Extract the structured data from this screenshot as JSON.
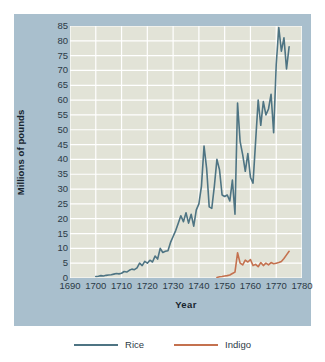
{
  "chart_data": {
    "type": "line",
    "title": "",
    "subtitle": "",
    "xlabel": "Year",
    "ylabel": "Millions of pounds",
    "xlim": [
      1690,
      1780
    ],
    "ylim": [
      0,
      85
    ],
    "xticks": [
      1690,
      1700,
      1710,
      1720,
      1730,
      1740,
      1750,
      1760,
      1770,
      1780
    ],
    "yticks": [
      0,
      5,
      10,
      15,
      20,
      25,
      30,
      35,
      40,
      45,
      50,
      55,
      60,
      65,
      70,
      75,
      80,
      85
    ],
    "grid": "both",
    "grid_color": "#ffffff",
    "plot_background": "#e2e3d7",
    "panel_background": "#a9bfcd",
    "legend_position": "bottom",
    "series": [
      {
        "name": "Rice",
        "color": "#4e7483",
        "x": [
          1700,
          1701,
          1702,
          1703,
          1704,
          1705,
          1706,
          1707,
          1708,
          1709,
          1710,
          1711,
          1712,
          1713,
          1714,
          1715,
          1716,
          1717,
          1718,
          1719,
          1720,
          1721,
          1722,
          1723,
          1724,
          1725,
          1726,
          1727,
          1728,
          1729,
          1730,
          1731,
          1732,
          1733,
          1734,
          1735,
          1736,
          1737,
          1738,
          1739,
          1740,
          1741,
          1742,
          1743,
          1744,
          1745,
          1746,
          1747,
          1748,
          1749,
          1750,
          1751,
          1752,
          1753,
          1754,
          1755,
          1756,
          1757,
          1758,
          1759,
          1760,
          1761,
          1762,
          1763,
          1764,
          1765,
          1766,
          1767,
          1768,
          1769,
          1770,
          1771,
          1772,
          1773,
          1774,
          1775
        ],
        "y": [
          0.5,
          0.6,
          0.8,
          0.7,
          0.9,
          1.0,
          1.1,
          1.3,
          1.5,
          1.4,
          1.6,
          2.2,
          2.0,
          2.6,
          3.0,
          2.8,
          3.4,
          5.0,
          4.2,
          5.6,
          5.0,
          6.0,
          5.4,
          7.4,
          6.4,
          10.0,
          8.6,
          9.0,
          9.2,
          12.0,
          14.0,
          16.0,
          18.5,
          21.0,
          19.0,
          22.0,
          18.5,
          21.5,
          17.5,
          23.0,
          25.0,
          31.0,
          44.5,
          37.0,
          24.0,
          23.5,
          31.0,
          40.0,
          36.5,
          28.0,
          27.5,
          28.0,
          26.0,
          33.0,
          21.5,
          59.0,
          46.0,
          41.5,
          36.0,
          42.0,
          34.0,
          32.0,
          46.0,
          60.0,
          51.5,
          59.5,
          55.0,
          57.0,
          62.0,
          49.0,
          72.0,
          84.5,
          76.5,
          81.0,
          70.5,
          78.0
        ]
      },
      {
        "name": "Indigo",
        "color": "#c4714f",
        "x": [
          1747,
          1748,
          1749,
          1750,
          1751,
          1752,
          1753,
          1754,
          1755,
          1756,
          1757,
          1758,
          1759,
          1760,
          1761,
          1762,
          1763,
          1764,
          1765,
          1766,
          1767,
          1768,
          1769,
          1770,
          1771,
          1772,
          1773,
          1774,
          1775
        ],
        "y": [
          0.2,
          0.4,
          0.5,
          0.7,
          0.8,
          1.0,
          1.5,
          2.0,
          8.5,
          5.0,
          4.4,
          6.0,
          5.4,
          6.2,
          4.2,
          4.6,
          3.8,
          5.2,
          4.2,
          5.0,
          4.4,
          5.2,
          4.8,
          5.0,
          5.2,
          5.6,
          6.6,
          7.8,
          9.0
        ]
      }
    ]
  },
  "axes": {
    "y_title": "Millions of pounds",
    "x_title": "Year",
    "y_tick_labels": [
      "85",
      "80",
      "75",
      "70",
      "65",
      "60",
      "55",
      "50",
      "45",
      "40",
      "35",
      "30",
      "25",
      "20",
      "15",
      "10",
      "5",
      "0"
    ],
    "x_tick_labels": [
      "1690",
      "1700",
      "1710",
      "1720",
      "1730",
      "1740",
      "1750",
      "1760",
      "1770",
      "1780"
    ]
  },
  "legend": {
    "entries": [
      {
        "label": "Rice",
        "color": "#4e7483"
      },
      {
        "label": "Indigo",
        "color": "#c4714f"
      }
    ]
  }
}
